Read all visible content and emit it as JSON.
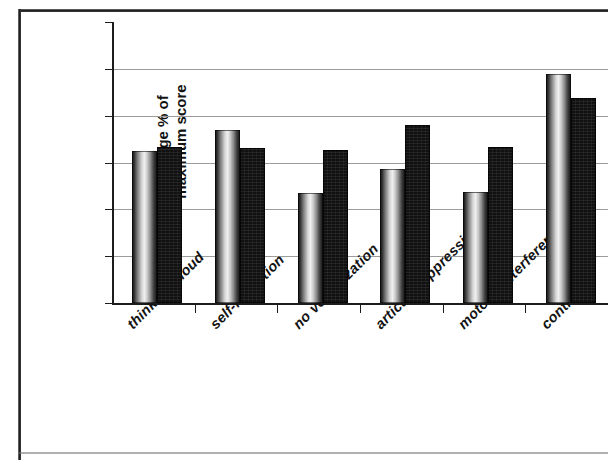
{
  "chart_data": {
    "type": "bar",
    "title": "",
    "subtitle": "",
    "xlabel": "",
    "ylabel": "average % of maximum score",
    "ylabel_lines": [
      "average % of",
      "maximum score"
    ],
    "categories": [
      "thinking aloud",
      "self-reflection",
      "no verbalization",
      "articul. suppression",
      "motoric interference",
      "controls"
    ],
    "series": [
      {
        "name": "series-1-light",
        "style": "light-gradient",
        "values": [
          32.5,
          37.0,
          23.4,
          28.6,
          23.8,
          48.8
        ]
      },
      {
        "name": "series-2-dark",
        "style": "solid-black",
        "values": [
          33.3,
          33.1,
          32.6,
          38.0,
          33.4,
          43.8
        ]
      }
    ],
    "ylim": [
      0,
      60
    ],
    "ytick_labels": [
      "0",
      "10",
      "20",
      "30",
      "40",
      "50",
      "60"
    ],
    "ytick_values": [
      0,
      10,
      20,
      30,
      40,
      50,
      60
    ],
    "grid": "horizontal",
    "gridline_values": [
      10,
      20,
      30,
      40,
      50
    ],
    "legend": "none",
    "legend_position": "none",
    "colors": {
      "gridline": "#9c9c9c",
      "axis": "#1c1c1c",
      "bar_light_peak": "#efefef",
      "bar_dark": "#111111",
      "text": "#131313",
      "background": "#ffffff"
    }
  }
}
